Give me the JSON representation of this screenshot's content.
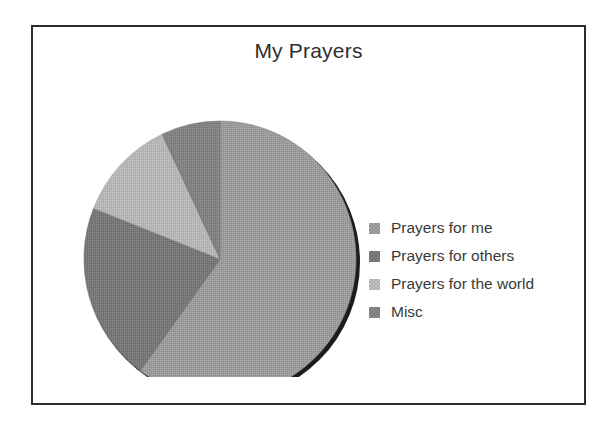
{
  "chart_data": {
    "type": "pie",
    "title": "My Prayers",
    "xlabel": "",
    "ylabel": "",
    "legend_position": "right",
    "grid": false,
    "categories": [
      "Prayers for me",
      "Prayers for others",
      "Prayers for the world",
      "Misc"
    ],
    "values": [
      60,
      21,
      12,
      7
    ],
    "units": "percent",
    "start_angle_deg": 0,
    "direction": "clockwise",
    "slices": [
      {
        "label": "Prayers for me",
        "value": 60,
        "start_deg": 0,
        "end_deg": 216,
        "color": "#9c9c9c"
      },
      {
        "label": "Prayers for others",
        "value": 21,
        "start_deg": 216,
        "end_deg": 291.6,
        "color": "#787878"
      },
      {
        "label": "Prayers for the world",
        "value": 12,
        "start_deg": 291.6,
        "end_deg": 334.8,
        "color": "#b6b6b6"
      },
      {
        "label": "Misc",
        "value": 7,
        "start_deg": 334.8,
        "end_deg": 360,
        "color": "#838383"
      }
    ]
  },
  "frame": {
    "border_color": "#2b2b2b",
    "background": "#ffffff"
  },
  "legend": {
    "items": [
      {
        "label": "Prayers for me",
        "color": "#9c9c9c"
      },
      {
        "label": "Prayers for others",
        "color": "#787878"
      },
      {
        "label": "Prayers for the world",
        "color": "#b6b6b6"
      },
      {
        "label": "Misc",
        "color": "#838383"
      }
    ]
  },
  "pie_geometry": {
    "center_x": 187,
    "center_y": 202,
    "radius_x": 136,
    "radius_y": 138,
    "shadow_color": "#1c1c1c",
    "edge_color": "#6b6b6b"
  }
}
